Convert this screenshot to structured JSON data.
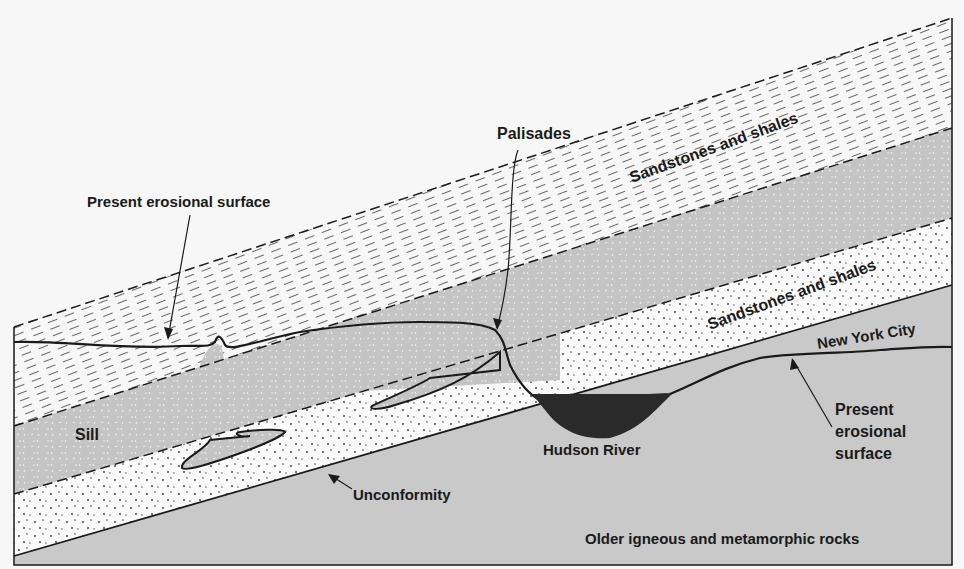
{
  "diagram": {
    "type": "geologic-cross-section",
    "colors": {
      "background": "#f7f7f7",
      "gray_rock": "#c9c9c9",
      "sill": "#c4c4c4",
      "sandstone": "#fbfbfb",
      "river": "#2a2a2a",
      "line": "#1a1a1a"
    },
    "labels": {
      "palisades": "Palisades",
      "present_erosional_surface_left": "Present erosional surface",
      "sandstones_upper": "Sandstones and shales",
      "sandstones_lower": "Sandstones and shales",
      "new_york_city": "New York City",
      "sill": "Sill",
      "hudson_river": "Hudson River",
      "present_erosional_surface_right_1": "Present",
      "present_erosional_surface_right_2": "erosional",
      "present_erosional_surface_right_3": "surface",
      "unconformity": "Unconformity",
      "older_rocks": "Older igneous and metamorphic rocks"
    },
    "layers": [
      {
        "name": "Sandstones and shales (upper, eroded)",
        "pattern": "dashes"
      },
      {
        "name": "Sill",
        "pattern": "igneous speckle"
      },
      {
        "name": "Sandstones and shales (lower)",
        "pattern": "dots"
      },
      {
        "name": "Older igneous and metamorphic rocks",
        "pattern": "gray"
      }
    ]
  }
}
